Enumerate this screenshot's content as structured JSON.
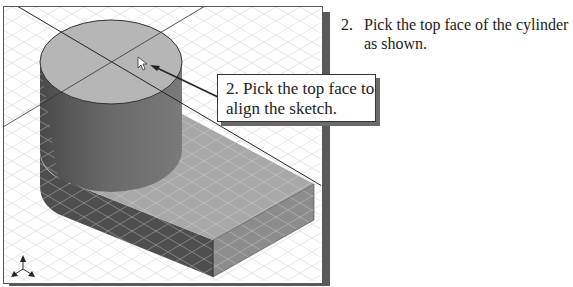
{
  "instruction": {
    "number": "2.",
    "text": "Pick the top face of the cylinder as shown."
  },
  "callout": {
    "text": "2. Pick the top face to\nalign the sketch."
  },
  "viewport": {
    "model": "cylinder-on-rectangular-block",
    "cursor": "arrow-pointer",
    "triad": "view-orientation-triad",
    "colors": {
      "top_face": "#b4b4b4",
      "cylinder_side": "#6e6e6e",
      "block_top": "#a9a9a9",
      "block_front": "#8a8a8a",
      "block_left": "#4e4e4e",
      "grid": "#dcdcdc"
    }
  }
}
